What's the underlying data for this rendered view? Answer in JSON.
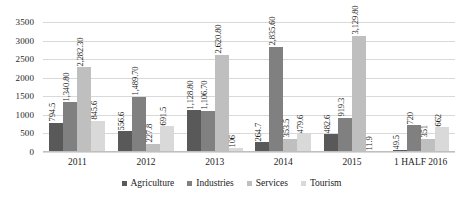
{
  "chart_data": {
    "type": "bar",
    "title": "",
    "subtitle": "",
    "xlabel": "",
    "ylabel": "",
    "categories": [
      "2011",
      "2012",
      "2013",
      "2014",
      "2015",
      "1 HALF 2016"
    ],
    "series": [
      {
        "name": "Agriculture",
        "color": "#595959",
        "values": [
          794.5,
          556.6,
          1128.8,
          264.7,
          482.6,
          49.5
        ],
        "labels": [
          "794.5",
          "556.6",
          "1,128.80",
          "264.7",
          "482.6",
          "49.5"
        ]
      },
      {
        "name": "Industries",
        "color": "#808080",
        "values": [
          1340.8,
          1489.7,
          1106.7,
          2835.6,
          919.3,
          720
        ],
        "labels": [
          "1,340.80",
          "1,489.70",
          "1,106.70",
          "2,835.60",
          "919.3",
          "720"
        ]
      },
      {
        "name": "Services",
        "color": "#bfbfbf",
        "values": [
          2282.3,
          227.8,
          2620.8,
          353.5,
          3129.8,
          351
        ],
        "labels": [
          "2,282.30",
          "227.8",
          "2,620.80",
          "353.5",
          "3,129.80",
          "351"
        ]
      },
      {
        "name": "Tourism",
        "color": "#d9d9d9",
        "values": [
          845.6,
          691.5,
          106,
          479.6,
          11.9,
          662
        ],
        "labels": [
          "845.6",
          "691.5",
          "106",
          "479.6",
          "11.9",
          "662"
        ]
      }
    ],
    "ylim": [
      0,
      3500
    ],
    "yticks": [
      0,
      500,
      1000,
      1500,
      2000,
      2500,
      3000,
      3500
    ],
    "ytick_labels": [
      "0",
      "500",
      "1000",
      "1500",
      "2000",
      "2500",
      "3000",
      "3500"
    ],
    "grid": true,
    "legend_position": "bottom",
    "data_labels": true,
    "data_label_rotation": -90
  },
  "axes": {
    "y_ticks": [
      "3500",
      "3000",
      "2500",
      "2000",
      "1500",
      "1000",
      "500",
      "0"
    ],
    "x_ticks": [
      "2011",
      "2012",
      "2013",
      "2014",
      "2015",
      "1 HALF 2016"
    ]
  },
  "legend": {
    "items": [
      {
        "label": "Agriculture",
        "color": "#595959"
      },
      {
        "label": "Industries",
        "color": "#808080"
      },
      {
        "label": "Services",
        "color": "#bfbfbf"
      },
      {
        "label": "Tourism",
        "color": "#d9d9d9"
      }
    ]
  }
}
